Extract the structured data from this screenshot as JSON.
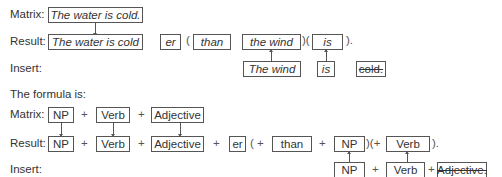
{
  "example": {
    "matrix_label": "Matrix:",
    "result_label": "Result:",
    "insert_label": "Insert:",
    "matrix_sentence": "The water is cold.",
    "result": {
      "sentence": "The water is cold",
      "er": "er",
      "open1": "(",
      "than": "than",
      "the_wind": "the wind",
      "mid": ")(",
      "is": "is",
      "close": ")."
    },
    "insert": {
      "the_wind": "The wind",
      "is": "is",
      "cold_deleted": "cold."
    }
  },
  "formula": {
    "heading": "The formula is:",
    "matrix_label": "Matrix:",
    "result_label": "Result:",
    "insert_label": "Insert:",
    "plus": "+",
    "matrix": {
      "np": "NP",
      "verb": "Verb",
      "adjective": "Adjective"
    },
    "result": {
      "np": "NP",
      "verb": "Verb",
      "adjective": "Adjective",
      "er": "er",
      "open1": "( +",
      "than": "than",
      "np2": "NP",
      "mid": ")(+",
      "verb2": "Verb",
      "close": ")."
    },
    "insert": {
      "np": "NP",
      "verb": "Verb",
      "adjective_deleted": "Adjective."
    }
  }
}
